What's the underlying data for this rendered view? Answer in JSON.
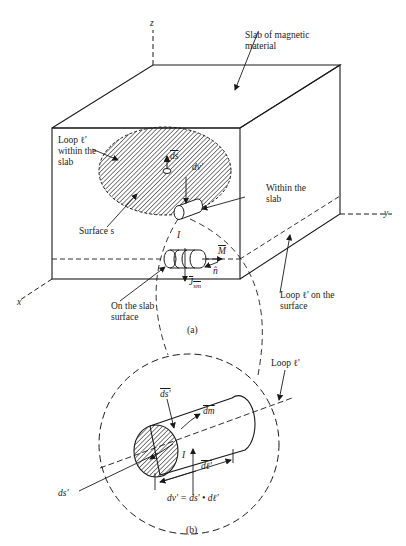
{
  "figure": {
    "axes": {
      "x": "x",
      "y": "y",
      "z": "z"
    },
    "part_a": {
      "caption": "(a)",
      "labels": {
        "slab": "Slab of magnetic\nmaterial",
        "loop_within": "Loop ℓ'\nwithin the\nslab",
        "ds": "ds",
        "dv": "dv'",
        "within_slab": "Within the\nslab",
        "surface_s": "Surface s",
        "current": "I",
        "M": "M",
        "n": "n̂",
        "J": "J",
        "J_sub": "sm",
        "on_surface": "On the slab\nsurface",
        "loop_on_surface": "Loop ℓ' on the\nsurface"
      }
    },
    "part_b": {
      "caption": "(b)",
      "labels": {
        "loop": "Loop ℓ'",
        "ds_vec": "ds'",
        "dm": "dm",
        "current": "I",
        "dl": "dℓ'",
        "ds_scalar": "ds'",
        "equation": "dv' = ds' • dℓ'"
      }
    },
    "colors": {
      "ink": "#1a1a1a",
      "background": "#ffffff"
    }
  }
}
